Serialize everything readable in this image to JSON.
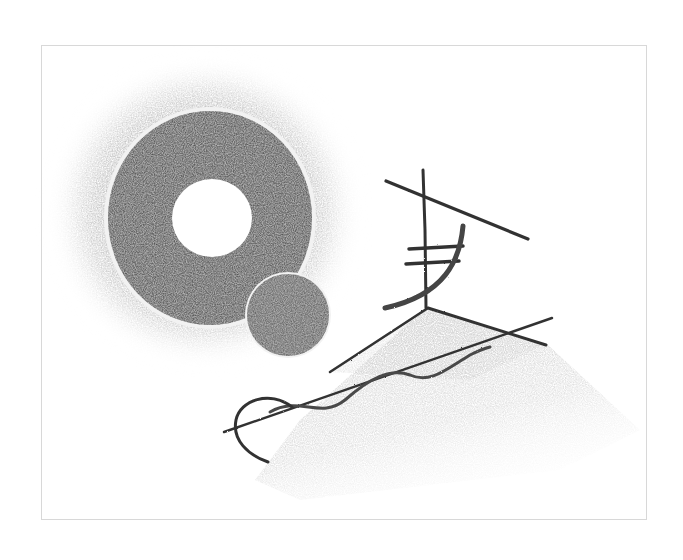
{
  "artwork": {
    "description": "Abstract pencil drawing: a dark shaded ring with white center and soft gray halo, a small dark disc, a shaded triangle with linear strokes, a wavy line and an arc",
    "colors": {
      "background": "#ffffff",
      "frame": "#d8d8d8",
      "halo": "#bdbdbd",
      "ring": "#4a4a4a",
      "disc": "#5e5e5e",
      "triangle_fill": "#d4d4d4",
      "stroke": "#3a3a3a"
    }
  }
}
